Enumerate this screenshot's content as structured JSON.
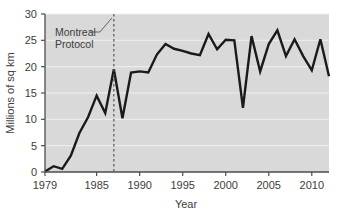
{
  "chart_data": {
    "type": "line",
    "title": "",
    "subtitle": "",
    "xlabel": "Year",
    "ylabel": "Millions of sq km",
    "xlim": [
      1979,
      2012
    ],
    "ylim": [
      0,
      30
    ],
    "grid": true,
    "legend": null,
    "legend_position": "none",
    "x_ticks": [
      "1979",
      "1985",
      "1990",
      "1995",
      "2000",
      "2005",
      "2010"
    ],
    "x_tick_values": [
      1979,
      1985,
      1990,
      1995,
      2000,
      2005,
      2010
    ],
    "y_ticks": [
      "0",
      "5",
      "10",
      "15",
      "20",
      "25",
      "30"
    ],
    "y_tick_values": [
      0,
      5,
      10,
      15,
      20,
      25,
      30
    ],
    "x": [
      1979,
      1980,
      1981,
      1982,
      1983,
      1984,
      1985,
      1986,
      1987,
      1988,
      1989,
      1990,
      1991,
      1992,
      1993,
      1994,
      1995,
      1996,
      1997,
      1998,
      1999,
      2000,
      2001,
      2002,
      2003,
      2004,
      2005,
      2006,
      2007,
      2008,
      2009,
      2010,
      2011,
      2012
    ],
    "values": [
      0.1,
      1.1,
      0.6,
      3.1,
      7.4,
      10.4,
      14.5,
      11.2,
      19.5,
      10.2,
      18.9,
      19.1,
      18.9,
      22.3,
      24.3,
      23.4,
      23.0,
      22.5,
      22.2,
      26.2,
      23.3,
      25.1,
      25.0,
      12.2,
      25.8,
      19.1,
      24.3,
      26.9,
      22.0,
      25.2,
      22.0,
      19.3,
      25.2,
      18.2
    ],
    "series": [
      {
        "name": "Ozone hole area",
        "color": "#1a1a1a",
        "values": [
          0.1,
          1.1,
          0.6,
          3.1,
          7.4,
          10.4,
          14.5,
          11.2,
          19.5,
          10.2,
          18.9,
          19.1,
          18.9,
          22.3,
          24.3,
          23.4,
          23.0,
          22.5,
          22.2,
          26.2,
          23.3,
          25.1,
          25.0,
          12.2,
          25.8,
          19.1,
          24.3,
          26.9,
          22.0,
          25.2,
          22.0,
          19.3,
          25.2,
          18.2
        ]
      }
    ],
    "annotations": [
      {
        "name": "montreal-protocol",
        "label_line1": "Montreal",
        "label_line2": "Protocol",
        "x_value": 1987,
        "marker": "dashed-vertical-line",
        "marker_color": "#555555",
        "leader_line": true
      }
    ],
    "plot_background": "#d9d9d9",
    "gridline_color": "#f0f0f0",
    "axis_color": "#4d4d4d"
  }
}
